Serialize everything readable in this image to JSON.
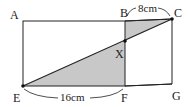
{
  "diagram": {
    "type": "geometry",
    "points": {
      "A": "A",
      "B": "B",
      "C": "C",
      "X": "X",
      "E": "E",
      "F": "F",
      "G": "G"
    },
    "measurements": {
      "BC": "8cm",
      "EF": "16cm"
    },
    "colors": {
      "shade": "#c8c8c8",
      "line": "#222222"
    }
  }
}
